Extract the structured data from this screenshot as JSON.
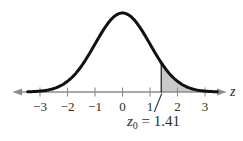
{
  "figure": {
    "axis_label": "z",
    "annotation": {
      "var": "z",
      "sub": "0",
      "rest": " = 1.41"
    }
  },
  "chart_data": {
    "type": "area",
    "title": "",
    "curve": "y = exp(-z^2/2)",
    "x_ticks": [
      -3,
      -2,
      -1,
      0,
      1,
      2,
      3
    ],
    "x_tick_labels": [
      "−3",
      "−2",
      "−1",
      "0",
      "1",
      "2",
      "3"
    ],
    "xlabel": "z",
    "z0": 1.41,
    "z0_label": "z0 = 1.41",
    "shaded_region": "z >= 1.41",
    "xlim": [
      -3.6,
      3.6
    ],
    "grid": false,
    "legend": false,
    "colors": {
      "curve": "#111111",
      "axis": "#8c8c8c",
      "shade": "#c9c9c9",
      "marker_line": "#333333",
      "text": "#2b2b2b"
    }
  }
}
